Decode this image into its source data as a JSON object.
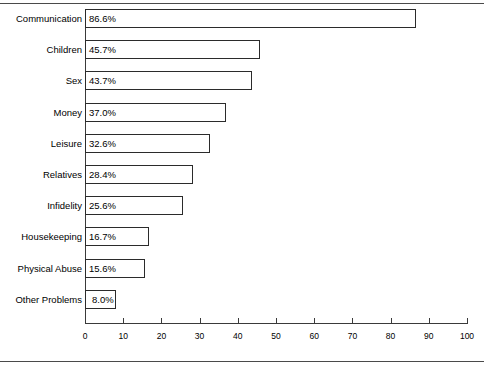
{
  "chart_data": {
    "type": "bar",
    "orientation": "horizontal",
    "title": "",
    "subtitle": "",
    "xlabel": "",
    "ylabel": "",
    "xlim": [
      0,
      100
    ],
    "xticks": [
      0,
      10,
      20,
      30,
      40,
      50,
      60,
      70,
      80,
      90,
      100
    ],
    "grid": false,
    "legend": false,
    "bar_fill_color": "#ffffff",
    "bar_border_color": "#2b2b2b",
    "axis_color": "#3a3a3a",
    "categories": [
      "Communication",
      "Children",
      "Sex",
      "Money",
      "Leisure",
      "Relatives",
      "Infidelity",
      "Housekeeping",
      "Physical Abuse",
      "Other Problems"
    ],
    "values": [
      86.6,
      45.7,
      43.7,
      37.0,
      32.6,
      28.4,
      25.6,
      16.7,
      15.6,
      8.0
    ],
    "value_labels": [
      "86.6%",
      "45.7%",
      "43.7%",
      "37.0%",
      "32.6%",
      "28.4%",
      "25.6%",
      "16.7%",
      "15.6%",
      "8.0%"
    ]
  },
  "rules": {
    "top": "horizontal-rule",
    "bottom": "horizontal-rule"
  }
}
